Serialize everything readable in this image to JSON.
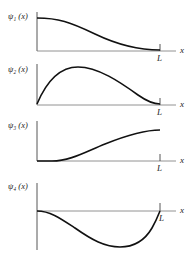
{
  "panels": [
    {
      "id": 1,
      "ylabel": "ψ₁ (x)",
      "xlabel": "x",
      "endlabel": "L",
      "description": "starts at maximum at x=0, decreases smoothly to zero at x=L"
    },
    {
      "id": 2,
      "ylabel": "ψ₂ (x)",
      "xlabel": "x",
      "endlabel": "L",
      "description": "starts at zero, rises to maximum near x≈0.25L, falls to zero at x=L"
    },
    {
      "id": 3,
      "ylabel": "ψ₃ (x)",
      "xlabel": "x",
      "endlabel": "L",
      "description": "starts at zero with zero slope, increases monotonically to maximum at x=L"
    },
    {
      "id": 4,
      "ylabel": "ψ₄ (x)",
      "xlabel": "x",
      "endlabel": "L",
      "description": "starts at zero, dips negative with minimum near x≈0.7L, returns to zero at x=L"
    }
  ],
  "colors": {
    "ink": "#111111",
    "axis": "#555555",
    "background": "#ffffff"
  }
}
